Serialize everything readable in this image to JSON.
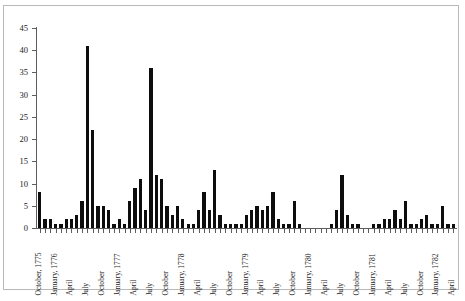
{
  "chart_data": {
    "type": "bar",
    "title": "",
    "xlabel": "",
    "ylabel": "",
    "ylim": [
      0,
      45
    ],
    "ytick_labels": [
      "0",
      "5",
      "10",
      "15",
      "20",
      "25",
      "30",
      "35",
      "40",
      "45"
    ],
    "ytick_values": [
      0,
      5,
      10,
      15,
      20,
      25,
      30,
      35,
      40,
      45
    ],
    "grid": false,
    "legend": "none",
    "bar_color": "#0d0d0d",
    "axis_color": "#5d5d5d",
    "categories": [
      "October, 1775",
      "November, 1775",
      "December, 1775",
      "January, 1776",
      "February, 1776",
      "March, 1776",
      "April, 1776",
      "May, 1776",
      "June, 1776",
      "July, 1776",
      "August, 1776",
      "September, 1776",
      "October, 1776",
      "November, 1776",
      "December, 1776",
      "January, 1777",
      "February, 1777",
      "March, 1777",
      "April, 1777",
      "May, 1777",
      "June, 1777",
      "July, 1777",
      "August, 1777",
      "September, 1777",
      "October, 1777",
      "November, 1777",
      "December, 1777",
      "January, 1778",
      "February, 1778",
      "March, 1778",
      "April, 1778",
      "May, 1778",
      "June, 1778",
      "July, 1778",
      "August, 1778",
      "September, 1778",
      "October, 1778",
      "November, 1778",
      "December, 1778",
      "January, 1779",
      "February, 1779",
      "March, 1779",
      "April, 1779",
      "May, 1779",
      "June, 1779",
      "July, 1779",
      "August, 1779",
      "September, 1779",
      "October, 1779",
      "November, 1779",
      "December, 1779",
      "January, 1780",
      "February, 1780",
      "March, 1780",
      "April, 1780",
      "May, 1780",
      "June, 1780",
      "July, 1780",
      "August, 1780",
      "September, 1780",
      "October, 1780",
      "November, 1780",
      "December, 1780",
      "January, 1781",
      "February, 1781",
      "March, 1781",
      "April, 1781",
      "May, 1781",
      "June, 1781",
      "July, 1781",
      "August, 1781",
      "September, 1781",
      "October, 1781",
      "November, 1781",
      "December, 1781",
      "January, 1782",
      "February, 1782",
      "March, 1782",
      "April, 1782"
    ],
    "values": [
      8,
      2,
      2,
      1,
      1,
      2,
      2,
      3,
      6,
      41,
      22,
      5,
      5,
      4,
      1,
      2,
      1,
      6,
      9,
      11,
      4,
      36,
      12,
      11,
      5,
      3,
      5,
      2,
      1,
      1,
      4,
      8,
      4,
      13,
      3,
      1,
      1,
      1,
      1,
      3,
      4,
      5,
      4,
      5,
      8,
      2,
      1,
      1,
      6,
      1,
      0,
      0,
      0,
      0,
      0,
      1,
      4,
      12,
      3,
      1,
      1,
      0,
      0,
      1,
      1,
      2,
      2,
      4,
      2,
      6,
      1,
      1,
      2,
      3,
      1,
      1,
      5,
      1,
      1
    ],
    "xtick_labels": [
      {
        "index": 0,
        "label": "October, 1775"
      },
      {
        "index": 3,
        "label": "January, 1776"
      },
      {
        "index": 6,
        "label": "April"
      },
      {
        "index": 9,
        "label": "July"
      },
      {
        "index": 12,
        "label": "October"
      },
      {
        "index": 15,
        "label": "January, 1777"
      },
      {
        "index": 18,
        "label": "April"
      },
      {
        "index": 21,
        "label": "July"
      },
      {
        "index": 24,
        "label": "October"
      },
      {
        "index": 27,
        "label": "January, 1778"
      },
      {
        "index": 30,
        "label": "April"
      },
      {
        "index": 33,
        "label": "July"
      },
      {
        "index": 36,
        "label": "October"
      },
      {
        "index": 39,
        "label": "January, 1779"
      },
      {
        "index": 42,
        "label": "April"
      },
      {
        "index": 45,
        "label": "July"
      },
      {
        "index": 48,
        "label": "October"
      },
      {
        "index": 51,
        "label": "January, 1780"
      },
      {
        "index": 54,
        "label": "April"
      },
      {
        "index": 57,
        "label": "July"
      },
      {
        "index": 60,
        "label": "October"
      },
      {
        "index": 63,
        "label": "January, 1781"
      },
      {
        "index": 66,
        "label": "April"
      },
      {
        "index": 69,
        "label": "July"
      },
      {
        "index": 72,
        "label": "October"
      },
      {
        "index": 75,
        "label": "January, 1782"
      },
      {
        "index": 78,
        "label": "April"
      }
    ]
  },
  "caption": ""
}
